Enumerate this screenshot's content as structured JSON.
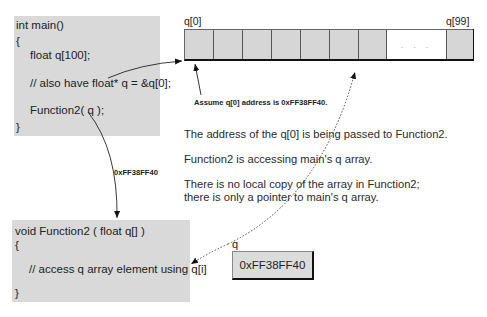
{
  "main_box": {
    "lines": [
      "int main()",
      "{",
      "float q[100];",
      "// also have float* q = &q[0];",
      "Function2( q );",
      "}"
    ]
  },
  "array": {
    "first_label": "q[0]",
    "last_label": "q[99]",
    "gap_text": ". . .",
    "cell_color": "#d6d6d6",
    "visible_cells": 8
  },
  "annotations": {
    "assume": "Assume q[0] address is 0xFF38FF40.",
    "passed_value": "0xFF38FF40",
    "notes": [
      "The address of the q[0] is being passed to Function2.",
      "Function2 is accessing main's q array.",
      "There is no local copy of the array in Function2;",
      "there is only a pointer to main's q array."
    ]
  },
  "function2_box": {
    "lines": [
      "void Function2 ( float q[] )",
      "{",
      "// access q array element using q[i]",
      "}"
    ]
  },
  "pointer": {
    "label": "q",
    "value": "0xFF38FF40"
  },
  "colors": {
    "box_fill": "#d9d9d9",
    "line": "#222222"
  }
}
